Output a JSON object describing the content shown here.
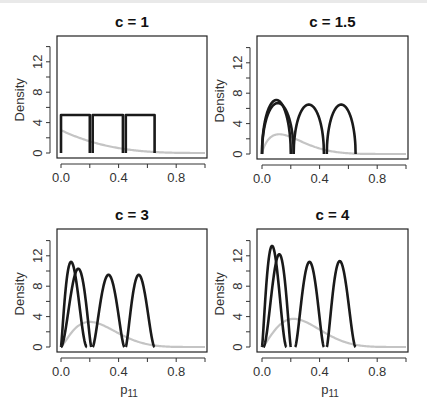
{
  "figure": {
    "ylabel": "Density",
    "xlabel": "p",
    "xlabel_sub": "11",
    "xticks": [
      "0.0",
      "0.4",
      "0.8"
    ],
    "yticks": [
      "0",
      "4",
      "8",
      "12"
    ]
  },
  "chart_data": [
    {
      "type": "line",
      "title": "c = 1",
      "xlabel": "",
      "ylabel": "Density",
      "xlim": [
        0,
        1
      ],
      "ylim": [
        0,
        14
      ],
      "x_tick_labels": [
        "0.0",
        "0.4",
        "0.8"
      ],
      "y_tick_labels": [
        "0",
        "4",
        "8",
        "12"
      ],
      "grid": false,
      "series": [
        {
          "name": "component-1",
          "color": "#1a1a1a",
          "shape": "uniform",
          "support": [
            0.0,
            0.2
          ],
          "peak": 5.0
        },
        {
          "name": "component-2",
          "color": "#1a1a1a",
          "shape": "uniform",
          "support": [
            0.22,
            0.43
          ],
          "peak": 5.0
        },
        {
          "name": "component-3",
          "color": "#1a1a1a",
          "shape": "uniform",
          "support": [
            0.45,
            0.65
          ],
          "peak": 5.0
        },
        {
          "name": "prior",
          "color": "#c4c4c4",
          "shape": "decay",
          "support": [
            0.0,
            1.0
          ],
          "peak": 3.0,
          "mode": 0.0
        }
      ]
    },
    {
      "type": "line",
      "title": "c = 1.5",
      "xlabel": "",
      "ylabel": "Density",
      "xlim": [
        0,
        1
      ],
      "ylim": [
        0,
        14
      ],
      "x_tick_labels": [
        "0.0",
        "0.4",
        "0.8"
      ],
      "y_tick_labels": [
        "0",
        "4",
        "8",
        "12"
      ],
      "grid": false,
      "series": [
        {
          "name": "component-1",
          "color": "#1a1a1a",
          "shape": "arc",
          "support": [
            0.0,
            0.2
          ],
          "peak": 7.1
        },
        {
          "name": "component-2",
          "color": "#1a1a1a",
          "shape": "arc",
          "support": [
            0.0,
            0.22
          ],
          "peak": 6.7
        },
        {
          "name": "component-3",
          "color": "#1a1a1a",
          "shape": "arc",
          "support": [
            0.22,
            0.43
          ],
          "peak": 6.5
        },
        {
          "name": "component-4",
          "color": "#1a1a1a",
          "shape": "arc",
          "support": [
            0.45,
            0.65
          ],
          "peak": 6.5
        },
        {
          "name": "prior",
          "color": "#c4c4c4",
          "shape": "hump",
          "support": [
            0.0,
            1.0
          ],
          "peak": 2.6,
          "mode": 0.12
        }
      ]
    },
    {
      "type": "line",
      "title": "c = 3",
      "xlabel": "p11",
      "ylabel": "Density",
      "xlim": [
        0,
        1
      ],
      "ylim": [
        0,
        14
      ],
      "x_tick_labels": [
        "0.0",
        "0.4",
        "0.8"
      ],
      "y_tick_labels": [
        "0",
        "4",
        "8",
        "12"
      ],
      "grid": false,
      "series": [
        {
          "name": "component-1",
          "color": "#1a1a1a",
          "shape": "bell",
          "support": [
            0.0,
            0.18
          ],
          "peak": 11.2,
          "mode": 0.07
        },
        {
          "name": "component-2",
          "color": "#1a1a1a",
          "shape": "bell",
          "support": [
            0.0,
            0.21
          ],
          "peak": 10.3,
          "mode": 0.12
        },
        {
          "name": "component-3",
          "color": "#1a1a1a",
          "shape": "bell",
          "support": [
            0.22,
            0.44
          ],
          "peak": 9.5,
          "mode": 0.33
        },
        {
          "name": "component-4",
          "color": "#1a1a1a",
          "shape": "bell",
          "support": [
            0.45,
            0.65
          ],
          "peak": 9.5,
          "mode": 0.54
        },
        {
          "name": "prior",
          "color": "#c4c4c4",
          "shape": "hump",
          "support": [
            0.0,
            1.0
          ],
          "peak": 3.3,
          "mode": 0.2
        }
      ]
    },
    {
      "type": "line",
      "title": "c = 4",
      "xlabel": "p11",
      "ylabel": "Density",
      "xlim": [
        0,
        1
      ],
      "ylim": [
        0,
        14
      ],
      "x_tick_labels": [
        "0.0",
        "0.4",
        "0.8"
      ],
      "y_tick_labels": [
        "0",
        "4",
        "8",
        "12"
      ],
      "grid": false,
      "series": [
        {
          "name": "component-1",
          "color": "#1a1a1a",
          "shape": "bell",
          "support": [
            0.0,
            0.17
          ],
          "peak": 13.3,
          "mode": 0.07
        },
        {
          "name": "component-2",
          "color": "#1a1a1a",
          "shape": "bell",
          "support": [
            0.01,
            0.2
          ],
          "peak": 12.2,
          "mode": 0.12
        },
        {
          "name": "component-3",
          "color": "#1a1a1a",
          "shape": "bell",
          "support": [
            0.23,
            0.43
          ],
          "peak": 11.2,
          "mode": 0.33
        },
        {
          "name": "component-4",
          "color": "#1a1a1a",
          "shape": "bell",
          "support": [
            0.45,
            0.65
          ],
          "peak": 11.3,
          "mode": 0.54
        },
        {
          "name": "prior",
          "color": "#c4c4c4",
          "shape": "hump",
          "support": [
            0.0,
            1.0
          ],
          "peak": 3.7,
          "mode": 0.22
        }
      ]
    }
  ]
}
